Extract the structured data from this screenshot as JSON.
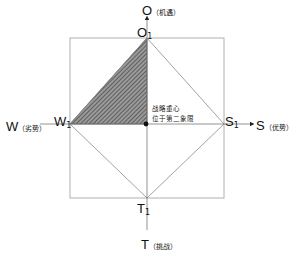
{
  "axes": {
    "top": {
      "letter": "O",
      "note": "（机遇）"
    },
    "right": {
      "letter": "S",
      "note": "（优势）"
    },
    "left": {
      "letter": "W",
      "note": "（劣势）"
    },
    "bottom": {
      "letter": "T",
      "note": "（挑战）"
    }
  },
  "vertices": {
    "top": {
      "letter": "O",
      "sub": "1"
    },
    "right": {
      "letter": "S",
      "sub": "1"
    },
    "left": {
      "letter": "W",
      "sub": "1"
    },
    "bottom": {
      "letter": "T",
      "sub": "1"
    }
  },
  "annotation": {
    "line1": "战略重心",
    "line2": "位于第二象限"
  },
  "colors": {
    "axis": "#555555",
    "box": "#aaaaaa",
    "hatch": "#555555"
  }
}
